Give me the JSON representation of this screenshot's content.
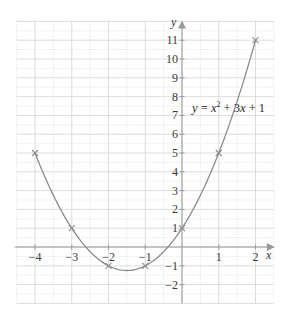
{
  "chart_data": {
    "type": "line",
    "title": "",
    "xlabel": "x",
    "ylabel": "y",
    "xlim": [
      -4.5,
      2.5
    ],
    "ylim": [
      -3,
      12
    ],
    "grid": true,
    "grid_style": "solid light gray at integers, dotted at half-integers",
    "x_ticks": [
      -4,
      -3,
      -2,
      -1,
      1,
      2
    ],
    "x_tick_labels": [
      "−4",
      "−3",
      "−2",
      "−1",
      "1",
      "2"
    ],
    "y_ticks": [
      -2,
      -1,
      1,
      2,
      3,
      4,
      5,
      6,
      7,
      8,
      9,
      10,
      11
    ],
    "y_tick_labels": [
      "−2",
      "−1",
      "1",
      "2",
      "3",
      "4",
      "5",
      "6",
      "7",
      "8",
      "9",
      "10",
      "11"
    ],
    "series": [
      {
        "name": "y = x^2 + 3x + 1",
        "function": "x^2 + 3x + 1",
        "plotted_points": {
          "x": [
            -4,
            -3,
            -2,
            -1,
            0,
            1,
            2
          ],
          "y": [
            5,
            1,
            -1,
            -1,
            1,
            5,
            11
          ]
        },
        "marker": "x",
        "color": "#8c8c8c"
      }
    ],
    "annotations": [
      {
        "text": "y = x² + 3x + 1",
        "x": 0.3,
        "y": 7.2
      }
    ]
  },
  "labels": {
    "x_axis": "x",
    "y_axis": "y",
    "equation_y": "y",
    "equation_eq": " = ",
    "equation_x": "x",
    "equation_exp": "2",
    "equation_rest_a": " + 3",
    "equation_rest_x": "x",
    "equation_rest_b": " + 1"
  },
  "colors": {
    "curve": "#8c8c8c",
    "axis": "#9a9a9a",
    "grid": "#d4d4d4",
    "text": "#3a3a3a"
  }
}
